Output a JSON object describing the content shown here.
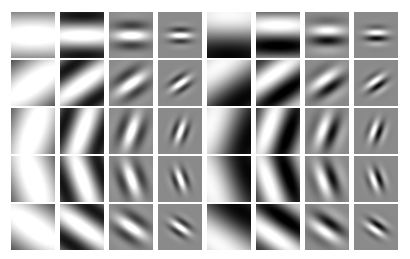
{
  "figure": {
    "rows": 5,
    "cols": 8,
    "background": "#ffffff",
    "mid_gray": "#8a8a8a",
    "orientations_deg": [
      0,
      35,
      70,
      110,
      145
    ],
    "columns": [
      {
        "phase": "even",
        "cycles": 0.45,
        "sigma": 1.6,
        "bg": "#a8a8a8"
      },
      {
        "phase": "even",
        "cycles": 1.0,
        "sigma": 1.2,
        "bg": "#9a9a9a"
      },
      {
        "phase": "even",
        "cycles": 1.9,
        "sigma": 0.42,
        "bg": "#8c8c8c"
      },
      {
        "phase": "even",
        "cycles": 3.4,
        "sigma": 0.26,
        "bg": "#8a8a8a"
      },
      {
        "phase": "odd",
        "cycles": 0.45,
        "sigma": 1.6,
        "bg": "#8a8a8a"
      },
      {
        "phase": "odd",
        "cycles": 1.0,
        "sigma": 1.2,
        "bg": "#8a8a8a"
      },
      {
        "phase": "odd",
        "cycles": 1.9,
        "sigma": 0.42,
        "bg": "#8a8a8a"
      },
      {
        "phase": "odd",
        "cycles": 3.4,
        "sigma": 0.26,
        "bg": "#8a8a8a"
      }
    ],
    "cell_width": 44,
    "cell_height": 46,
    "col_pitch": 49,
    "row_pitch": 48
  }
}
